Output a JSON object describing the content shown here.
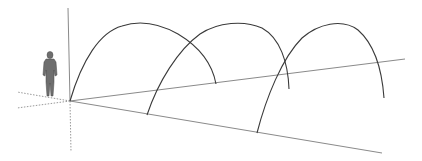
{
  "scene": {
    "description": "3D viewport with three parabolic arches along axis lines and a scale figure",
    "colors": {
      "background": "#ffffff",
      "arch": "#3a3a3a",
      "axis_solid": "#8a8a8a",
      "axis_dotted": "#9a9a9a",
      "figure": "#6e6e6e"
    },
    "origin": [
      70,
      101
    ],
    "axes": {
      "blue_vertical": {
        "from": [
          70,
          101
        ],
        "to": [
          68,
          8
        ]
      },
      "green_solid": {
        "from": [
          70,
          101
        ],
        "to": [
          405,
          59
        ]
      },
      "red_solid": {
        "from": [
          70,
          101
        ],
        "to": [
          382,
          153
        ]
      },
      "dotted_down": {
        "from": [
          70,
          101
        ],
        "to": [
          71,
          152
        ]
      },
      "dotted_left_upper": {
        "from": [
          70,
          101
        ],
        "to": [
          17,
          92
        ]
      },
      "dotted_left_lower": {
        "from": [
          70,
          101
        ],
        "to": [
          17,
          108
        ]
      }
    },
    "arches": [
      {
        "name": "arch-1",
        "left_foot": [
          70,
          101
        ],
        "peak": [
          135,
          24
        ],
        "right_foot": [
          216,
          84
        ]
      },
      {
        "name": "arch-2",
        "left_foot": [
          147,
          115
        ],
        "peak": [
          232,
          24
        ],
        "right_foot": [
          289,
          89
        ]
      },
      {
        "name": "arch-3",
        "left_foot": [
          257,
          133
        ],
        "peak": [
          335,
          23
        ],
        "right_foot": [
          384,
          98
        ]
      }
    ],
    "figure": {
      "name": "scale-person",
      "x": 44,
      "y": 51,
      "height": 46
    }
  }
}
